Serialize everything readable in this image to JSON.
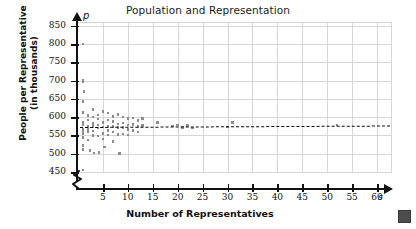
{
  "chart_data": {
    "type": "scatter",
    "title": "Population and Representation",
    "xlabel": "Number of Representatives",
    "ylabel": "People per Representative (in thousands)",
    "x_axis_variable": "s",
    "y_axis_variable": "p",
    "xlim": [
      0,
      63
    ],
    "ylim": [
      450,
      860
    ],
    "y_axis_break_below": 450,
    "grid": true,
    "legend": "none",
    "xticks": [
      5,
      10,
      15,
      20,
      25,
      30,
      35,
      40,
      45,
      50,
      55,
      60
    ],
    "yticks": [
      450,
      500,
      550,
      600,
      650,
      700,
      750,
      800,
      850
    ],
    "marker_color": "#8c8c8c",
    "gridline_color": "#d6d6d6",
    "axis_color": "#111111",
    "trend_line": {
      "label": "line of best fit",
      "style": "dotted",
      "color": "#0a0a0a",
      "x_start": 0.4,
      "y_start": 574,
      "x_end": 62.5,
      "y_end": 578
    },
    "points": [
      {
        "x": 1,
        "y": 800
      },
      {
        "x": 1,
        "y": 700
      },
      {
        "x": 1,
        "y": 698
      },
      {
        "x": 1.2,
        "y": 670
      },
      {
        "x": 1,
        "y": 643
      },
      {
        "x": 1,
        "y": 613
      },
      {
        "x": 1,
        "y": 585
      },
      {
        "x": 1,
        "y": 580
      },
      {
        "x": 1,
        "y": 568
      },
      {
        "x": 1,
        "y": 560
      },
      {
        "x": 1,
        "y": 556
      },
      {
        "x": 1,
        "y": 545
      },
      {
        "x": 1,
        "y": 523
      },
      {
        "x": 1,
        "y": 511
      },
      {
        "x": 1,
        "y": 455
      },
      {
        "x": 2,
        "y": 604
      },
      {
        "x": 2,
        "y": 592
      },
      {
        "x": 2,
        "y": 575
      },
      {
        "x": 2,
        "y": 566
      },
      {
        "x": 2,
        "y": 560
      },
      {
        "x": 2,
        "y": 538
      },
      {
        "x": 2.4,
        "y": 508
      },
      {
        "x": 3,
        "y": 621
      },
      {
        "x": 3,
        "y": 600
      },
      {
        "x": 3,
        "y": 583
      },
      {
        "x": 3,
        "y": 575
      },
      {
        "x": 3,
        "y": 562
      },
      {
        "x": 3,
        "y": 550
      },
      {
        "x": 3.2,
        "y": 502
      },
      {
        "x": 4,
        "y": 606
      },
      {
        "x": 4,
        "y": 595
      },
      {
        "x": 4,
        "y": 578
      },
      {
        "x": 4,
        "y": 570
      },
      {
        "x": 4,
        "y": 548
      },
      {
        "x": 4.2,
        "y": 504
      },
      {
        "x": 5,
        "y": 616
      },
      {
        "x": 5,
        "y": 586
      },
      {
        "x": 5,
        "y": 573
      },
      {
        "x": 5,
        "y": 556
      },
      {
        "x": 5,
        "y": 540
      },
      {
        "x": 5.3,
        "y": 518
      },
      {
        "x": 6,
        "y": 611
      },
      {
        "x": 6,
        "y": 592
      },
      {
        "x": 6,
        "y": 574
      },
      {
        "x": 6,
        "y": 563
      },
      {
        "x": 6,
        "y": 551
      },
      {
        "x": 7,
        "y": 602
      },
      {
        "x": 7,
        "y": 588
      },
      {
        "x": 7,
        "y": 575
      },
      {
        "x": 7,
        "y": 559
      },
      {
        "x": 7,
        "y": 534
      },
      {
        "x": 8,
        "y": 607
      },
      {
        "x": 8,
        "y": 581
      },
      {
        "x": 8,
        "y": 571
      },
      {
        "x": 8,
        "y": 553
      },
      {
        "x": 8.3,
        "y": 500
      },
      {
        "x": 9,
        "y": 600
      },
      {
        "x": 9,
        "y": 584
      },
      {
        "x": 9,
        "y": 572
      },
      {
        "x": 9,
        "y": 554
      },
      {
        "x": 10,
        "y": 596
      },
      {
        "x": 10,
        "y": 578
      },
      {
        "x": 10,
        "y": 566
      },
      {
        "x": 10,
        "y": 551
      },
      {
        "x": 11,
        "y": 598
      },
      {
        "x": 11,
        "y": 580
      },
      {
        "x": 11,
        "y": 563
      },
      {
        "x": 12,
        "y": 590
      },
      {
        "x": 12,
        "y": 574
      },
      {
        "x": 12,
        "y": 559
      },
      {
        "x": 13,
        "y": 596
      },
      {
        "x": 13,
        "y": 577
      },
      {
        "x": 16,
        "y": 585
      },
      {
        "x": 19,
        "y": 576
      },
      {
        "x": 20,
        "y": 578
      },
      {
        "x": 21,
        "y": 572
      },
      {
        "x": 22,
        "y": 577
      },
      {
        "x": 23,
        "y": 570
      },
      {
        "x": 30,
        "y": 573
      },
      {
        "x": 31,
        "y": 586
      },
      {
        "x": 52,
        "y": 578
      }
    ]
  },
  "decoration": {
    "corner_marker_name": "page-corner-square",
    "corner_marker_color": "#4d4d4d"
  }
}
